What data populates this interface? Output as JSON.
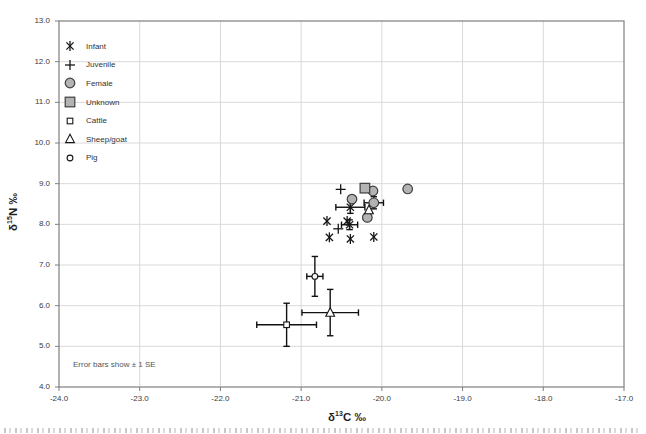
{
  "figure": {
    "note": "Error bars show ± 1 SE"
  },
  "chart_data": {
    "type": "scatter",
    "title": "",
    "xlabel": {
      "delta": "δ",
      "sup": "13",
      "rest": "C ‰"
    },
    "ylabel": {
      "delta": "δ",
      "sup": "15",
      "rest": "N ‰"
    },
    "xlim": [
      -24.0,
      -17.0
    ],
    "ylim": [
      4.0,
      13.0
    ],
    "grid": true,
    "legend_position": "top-left-inside",
    "note": "Error bars show ± 1 SE",
    "xticks": {
      "values": [
        -24,
        -23,
        -22,
        -21,
        -20,
        -19,
        -18,
        -17
      ],
      "labels": [
        "-24.0",
        "-23.0",
        "-22.0",
        "-21.0",
        "-20.0",
        "-19.0",
        "-18.0",
        "-17.0"
      ]
    },
    "yticks": {
      "values": [
        13,
        12,
        11,
        10,
        9,
        8,
        7,
        6,
        5,
        4
      ],
      "labels": [
        "13.0",
        "12.0",
        "11.0",
        "10.0",
        "9.0",
        "8.0",
        "7.0",
        "6.0",
        "5.0",
        "4.0"
      ]
    },
    "colors": {
      "gray_fill": "#b3b3b3",
      "gray_stroke": "#3f3f3f",
      "line_marker": "#161616",
      "errorbar": "#111111",
      "grid": "#d9d9d9",
      "frame": "#7f7f7f",
      "text": "#3a3a3a"
    },
    "series": [
      {
        "name": "Infant",
        "marker": "asterisk",
        "points": [
          {
            "x": -20.68,
            "y": 8.08
          },
          {
            "x": -20.43,
            "y": 8.08
          },
          {
            "x": -20.65,
            "y": 7.68
          },
          {
            "x": -20.39,
            "y": 7.64
          },
          {
            "x": -20.1,
            "y": 7.69
          },
          {
            "x": -20.39,
            "y": 8.42,
            "se_x": 0.18,
            "se_y": 0.15
          },
          {
            "x": -20.4,
            "y": 7.99,
            "se_x": 0.1,
            "se_y": 0.12
          }
        ]
      },
      {
        "name": "Juvenile",
        "marker": "plus",
        "points": [
          {
            "x": -20.51,
            "y": 8.86
          },
          {
            "x": -20.54,
            "y": 7.89
          }
        ]
      },
      {
        "name": "Female",
        "marker": "circle-gray",
        "points": [
          {
            "x": -20.11,
            "y": 8.82
          },
          {
            "x": -19.68,
            "y": 8.87
          },
          {
            "x": -20.37,
            "y": 8.62
          },
          {
            "x": -20.18,
            "y": 8.17
          },
          {
            "x": -20.1,
            "y": 8.53,
            "se_x": 0.12,
            "se_y": 0.15
          }
        ]
      },
      {
        "name": "Unknown",
        "marker": "square-gray",
        "points": [
          {
            "x": -20.21,
            "y": 8.89
          }
        ]
      },
      {
        "name": "Cattle",
        "marker": "square-open",
        "points": [
          {
            "x": -21.18,
            "y": 5.53,
            "se_x": 0.37,
            "se_y": 0.53
          }
        ]
      },
      {
        "name": "Sheep/goat",
        "marker": "triangle-open",
        "points": [
          {
            "x": -20.16,
            "y": 8.35
          },
          {
            "x": -20.64,
            "y": 5.83,
            "se_x": 0.35,
            "se_y": 0.57
          }
        ]
      },
      {
        "name": "Pig",
        "marker": "circle-open",
        "points": [
          {
            "x": -20.83,
            "y": 6.72,
            "se_x": 0.1,
            "se_y": 0.49
          }
        ]
      }
    ]
  }
}
